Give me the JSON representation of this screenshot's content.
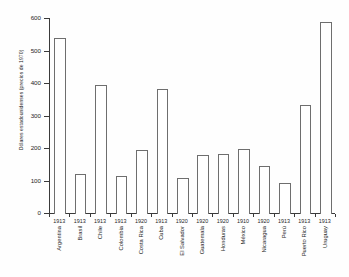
{
  "chart_data": {
    "type": "bar",
    "title": "",
    "xlabel": "",
    "ylabel": "Dólares estadounidenses (precios de 1970)",
    "ylim": [
      0,
      600
    ],
    "yticks": [
      0,
      100,
      200,
      300,
      400,
      500,
      600
    ],
    "ytick_labels": [
      "0",
      "100",
      "200",
      "300",
      "400",
      "500",
      "600"
    ],
    "grid": false,
    "legend": null,
    "categories": [
      "Argentina",
      "Brasil",
      "Chile",
      "Colombia",
      "Costa Rica",
      "Cuba",
      "El Salvador",
      "Guatemala",
      "Honduras",
      "México",
      "Nicaragua",
      "Perú",
      "Puerto Rico",
      "Uruguay"
    ],
    "years": [
      "1913",
      "1913",
      "1913",
      "1913",
      "1920",
      "1913",
      "1920",
      "1920",
      "1920",
      "1910",
      "1920",
      "1913",
      "1913",
      "1913"
    ],
    "values": [
      542,
      122,
      398,
      118,
      196,
      385,
      110,
      183,
      186,
      200,
      148,
      95,
      336,
      590
    ]
  }
}
